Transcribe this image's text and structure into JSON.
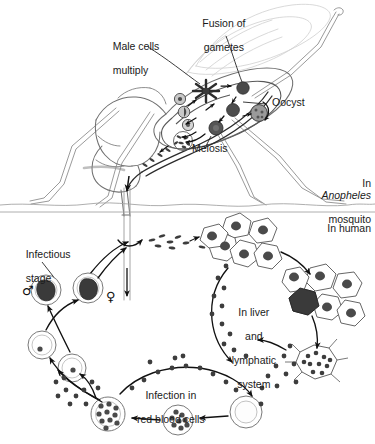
{
  "figure": {
    "background_color": "#ffffff",
    "ink_color": "#1a1a1a",
    "faint_color": "#b9b9b9",
    "parasite_fill": "#4d4d4d",
    "cell_outline": "#6e6e6e"
  },
  "sections": {
    "mosquito": {
      "label_line1": "In",
      "label_line2_italic": "Anopheles",
      "label_line3": "mosquito"
    },
    "human": {
      "label": "In human"
    }
  },
  "labels": {
    "male_cells": {
      "line1": "Male cells",
      "line2": "multiply"
    },
    "fusion": {
      "line1": "Fusion of",
      "line2": "gametes"
    },
    "oocyst": "Oocyst",
    "meiosis": "Meiosis",
    "infectious_stage": {
      "line1": "Infectious",
      "line2": "stage"
    },
    "liver": {
      "line1": "In liver",
      "line2": "and",
      "line3": "lymphatic",
      "line4": "system"
    },
    "rbc": {
      "line1": "Infection in",
      "line2": "red blood cells"
    }
  },
  "symbols": {
    "male": "♂",
    "female": "♀"
  },
  "stages": [
    {
      "name": "exflagellating-male-gametocyte",
      "location": "mosquito-midgut"
    },
    {
      "name": "zygote-fusion-of-gametes",
      "location": "mosquito-midgut"
    },
    {
      "name": "ookinete-meiosis",
      "location": "mosquito-midgut"
    },
    {
      "name": "oocyst",
      "location": "mosquito-midgut-wall"
    },
    {
      "name": "sporozoites",
      "location": "mosquito-salivary-gland"
    },
    {
      "name": "sporozoite-trail",
      "location": "human-bloodstream"
    },
    {
      "name": "liver-cell-cluster-primary",
      "location": "human-liver"
    },
    {
      "name": "liver-cell-cluster-infected",
      "location": "human-liver"
    },
    {
      "name": "rupturing-liver-cell-merozoites",
      "location": "human-liver"
    },
    {
      "name": "red-blood-cell-uninfected",
      "location": "human-blood"
    },
    {
      "name": "trophozoite-in-rbc",
      "location": "human-blood"
    },
    {
      "name": "schizont-in-rbc",
      "location": "human-blood"
    },
    {
      "name": "ring-stage-rbc",
      "location": "human-blood"
    },
    {
      "name": "male-gametocyte",
      "location": "human-blood"
    },
    {
      "name": "female-gametocyte",
      "location": "human-blood"
    }
  ]
}
